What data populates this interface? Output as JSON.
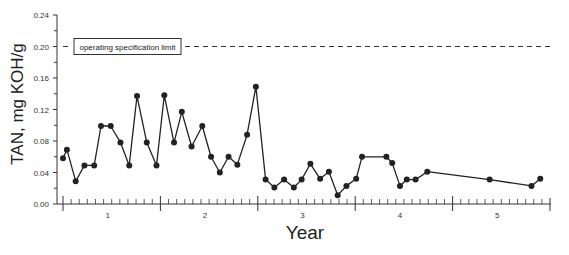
{
  "chart_data": {
    "type": "line",
    "title": "",
    "xlabel": "Year",
    "ylabel": "TAN, mg KOH/g",
    "ylim": [
      0.0,
      0.24
    ],
    "xlim": [
      0,
      5
    ],
    "yticks": [
      "0.00",
      "0.04",
      "0.08",
      "0.12",
      "0.16",
      "0.20",
      "0.24"
    ],
    "ytick_values": [
      0.0,
      0.04,
      0.08,
      0.12,
      0.16,
      0.2,
      0.24
    ],
    "xtick_labels": [
      "1",
      "2",
      "3",
      "4",
      "5"
    ],
    "xtick_label_positions": [
      0.5,
      1.5,
      2.5,
      3.5,
      4.5
    ],
    "x_major_ticks": [
      0,
      1,
      2,
      3,
      4,
      5
    ],
    "x_minor_ticks_per_year": 12,
    "grid": false,
    "legend": null,
    "annotations": [
      {
        "type": "hline",
        "y": 0.2,
        "style": "dashed",
        "label": "operating specification limit"
      }
    ],
    "series": [
      {
        "name": "TAN",
        "marker": "circle",
        "color": "#222222",
        "x": [
          0.0,
          0.04,
          0.13,
          0.22,
          0.32,
          0.39,
          0.49,
          0.59,
          0.68,
          0.76,
          0.86,
          0.96,
          1.04,
          1.14,
          1.22,
          1.32,
          1.43,
          1.52,
          1.61,
          1.7,
          1.79,
          1.89,
          1.98,
          2.08,
          2.17,
          2.27,
          2.37,
          2.45,
          2.54,
          2.64,
          2.73,
          2.82,
          2.91,
          3.01,
          3.07,
          3.32,
          3.38,
          3.46,
          3.53,
          3.62,
          3.74,
          4.38,
          4.81,
          4.9
        ],
        "values": [
          0.058,
          0.069,
          0.029,
          0.049,
          0.049,
          0.099,
          0.099,
          0.078,
          0.049,
          0.137,
          0.078,
          0.049,
          0.138,
          0.078,
          0.117,
          0.073,
          0.099,
          0.06,
          0.04,
          0.06,
          0.05,
          0.088,
          0.149,
          0.031,
          0.021,
          0.031,
          0.021,
          0.031,
          0.051,
          0.032,
          0.041,
          0.011,
          0.023,
          0.032,
          0.06,
          0.06,
          0.052,
          0.023,
          0.031,
          0.031,
          0.041,
          0.031,
          0.023,
          0.032
        ]
      }
    ]
  },
  "labels": {
    "y_axis_title": "TAN, mg KOH/g",
    "x_axis_title": "Year",
    "limit_label": "operating specification limit"
  }
}
